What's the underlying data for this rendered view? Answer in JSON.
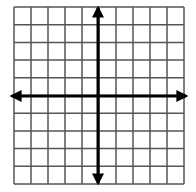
{
  "diagram": {
    "type": "coordinate-grid",
    "columns": 10,
    "rows": 10,
    "grid": {
      "left": 14,
      "top": 7,
      "right": 184,
      "bottom": 184
    },
    "origin": {
      "x": 98,
      "y": 96
    },
    "colors": {
      "background": "#ffffff",
      "grid_line": "#555555",
      "axis": "#000000"
    },
    "axes": {
      "x_axis": {
        "arrows": [
          "left",
          "right"
        ]
      },
      "y_axis": {
        "arrows": [
          "up",
          "down"
        ]
      }
    }
  }
}
